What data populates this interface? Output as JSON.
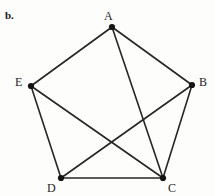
{
  "figure": {
    "part_label": "b.",
    "background_color": "#fdfdfc",
    "line_color": "#262626",
    "vertex_color": "#141414",
    "label_color": "#1d1d1d",
    "width": 214,
    "height": 196
  },
  "graph": {
    "type": "undirected-graph",
    "vertex_count": 5,
    "edge_count": 8,
    "vertices": [
      {
        "id": "A",
        "label": "A",
        "x": 112,
        "y": 27,
        "label_x": 104,
        "label_y": 10,
        "degree": 3
      },
      {
        "id": "B",
        "label": "B",
        "x": 192,
        "y": 85,
        "label_x": 199,
        "label_y": 76,
        "degree": 3
      },
      {
        "id": "C",
        "label": "C",
        "x": 163,
        "y": 178,
        "label_x": 168,
        "label_y": 182,
        "degree": 4
      },
      {
        "id": "D",
        "label": "D",
        "x": 61,
        "y": 178,
        "label_x": 47,
        "label_y": 182,
        "degree": 3
      },
      {
        "id": "E",
        "label": "E",
        "x": 31,
        "y": 86,
        "label_x": 15,
        "label_y": 76,
        "degree": 3
      }
    ],
    "edges": [
      {
        "id": "edge-AE",
        "from": "A",
        "to": "E"
      },
      {
        "id": "edge-AB",
        "from": "A",
        "to": "B"
      },
      {
        "id": "edge-AC",
        "from": "A",
        "to": "C"
      },
      {
        "id": "edge-EC",
        "from": "E",
        "to": "C"
      },
      {
        "id": "edge-ED",
        "from": "E",
        "to": "D"
      },
      {
        "id": "edge-BD",
        "from": "B",
        "to": "D"
      },
      {
        "id": "edge-BC",
        "from": "B",
        "to": "C"
      },
      {
        "id": "edge-DC",
        "from": "D",
        "to": "C"
      }
    ]
  }
}
